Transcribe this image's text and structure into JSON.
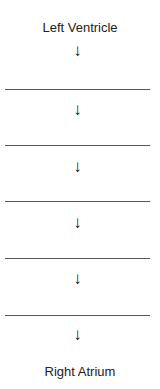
{
  "diagram": {
    "top_label": "Left Ventricle",
    "bottom_label": "Right Atrium",
    "arrow_glyph": "↓",
    "steps": [
      {
        "blank": ""
      },
      {
        "blank": ""
      },
      {
        "blank": ""
      },
      {
        "blank": ""
      },
      {
        "blank": ""
      }
    ],
    "line_color": "#555555"
  }
}
